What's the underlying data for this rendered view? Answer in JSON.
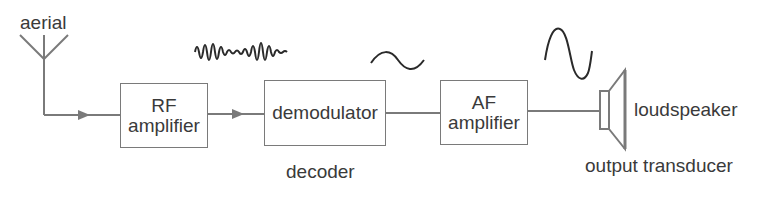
{
  "diagram": {
    "title": "",
    "labels": {
      "aerial": "aerial",
      "decoder": "decoder",
      "loudspeaker": "loudspeaker",
      "output_transducer": "output transducer"
    },
    "blocks": [
      {
        "id": "rf",
        "line1": "RF",
        "line2": "amplifier"
      },
      {
        "id": "demod",
        "line1": "demodulator"
      },
      {
        "id": "af",
        "line1": "AF",
        "line2": "amplifier"
      }
    ],
    "signals": [
      {
        "id": "modulated-rf",
        "type": "amplitude-modulated wave"
      },
      {
        "id": "audio-small",
        "type": "small sine wave"
      },
      {
        "id": "audio-large",
        "type": "large sine wave"
      }
    ],
    "colors": {
      "line": "#7a7a7a",
      "text": "#3a3a3a",
      "wave": "#2a2a2a"
    }
  }
}
